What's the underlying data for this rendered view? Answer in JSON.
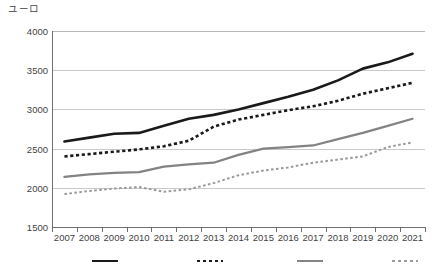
{
  "chart_data": {
    "type": "line",
    "title": "",
    "ylabel": "ユーロ",
    "xlabel": "",
    "categories": [
      "2007",
      "2008",
      "2009",
      "2010",
      "2011",
      "2012",
      "2013",
      "2014",
      "2015",
      "2016",
      "2017",
      "2018",
      "2019",
      "2020",
      "2021"
    ],
    "ylim": [
      1500,
      4000
    ],
    "ytick_values": [
      1500,
      2000,
      2500,
      3000,
      3500,
      4000
    ],
    "ytick_labels": [
      "1500",
      "2000",
      "2500",
      "3000",
      "3500",
      "4000"
    ],
    "grid": true,
    "legend_position": "bottom",
    "series": [
      {
        "name": "系列1",
        "style": "solid",
        "color": "#1a1a1a",
        "values": [
          2590,
          2640,
          2690,
          2700,
          2790,
          2880,
          2930,
          3000,
          3080,
          3160,
          3250,
          3370,
          3520,
          3600,
          3710
        ]
      },
      {
        "name": "系列2",
        "style": "dashed",
        "color": "#1a1a1a",
        "values": [
          2400,
          2430,
          2460,
          2490,
          2530,
          2600,
          2780,
          2870,
          2930,
          2990,
          3040,
          3110,
          3200,
          3270,
          3340
        ]
      },
      {
        "name": "系列3",
        "style": "solid",
        "color": "#838383",
        "values": [
          2140,
          2170,
          2190,
          2200,
          2270,
          2300,
          2320,
          2420,
          2500,
          2520,
          2540,
          2620,
          2700,
          2790,
          2880
        ]
      },
      {
        "name": "系列4",
        "style": "dashed",
        "color": "#9a9a9a",
        "values": [
          1920,
          1960,
          1990,
          2010,
          1950,
          1980,
          2060,
          2160,
          2220,
          2260,
          2320,
          2360,
          2400,
          2520,
          2580
        ]
      }
    ]
  },
  "legend": {
    "items": [
      {
        "label": "",
        "color": "#1a1a1a",
        "style": "solid"
      },
      {
        "label": "",
        "color": "#1a1a1a",
        "style": "dashed"
      },
      {
        "label": "",
        "color": "#838383",
        "style": "solid"
      },
      {
        "label": "",
        "color": "#9a9a9a",
        "style": "dashed"
      }
    ]
  }
}
